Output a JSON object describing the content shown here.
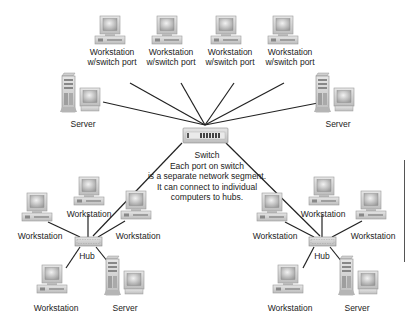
{
  "diagram": {
    "switch": {
      "label": "Switch",
      "description": [
        "Each port on switch",
        "is a separate network segment.",
        "It can connect to individual",
        "computers to hubs."
      ]
    },
    "top_workstations": [
      {
        "line1": "Workstation",
        "line2": "w/switch port"
      },
      {
        "line1": "Workstation",
        "line2": "w/switch port"
      },
      {
        "line1": "Workstation",
        "line2": "w/switch port"
      },
      {
        "line1": "Workstation",
        "line2": "w/switch port"
      }
    ],
    "servers_top": [
      {
        "label": "Server"
      },
      {
        "label": "Server"
      }
    ],
    "left_hub": {
      "label": "Hub",
      "workstations": [
        "Workstation",
        "Workstation",
        "Workstation",
        "Workstation"
      ],
      "server": "Server"
    },
    "right_hub": {
      "label": "Hub",
      "workstations": [
        "Workstation",
        "Workstation",
        "Workstation",
        "Workstation"
      ],
      "server": "Server"
    }
  },
  "colors": {
    "line": "#222222",
    "device_body": "#d6d6d6",
    "screen": "#b8b8b8",
    "background": "#ffffff"
  }
}
